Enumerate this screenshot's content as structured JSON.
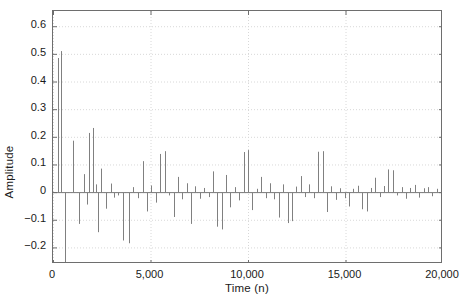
{
  "chart_data": {
    "type": "line",
    "subtype": "stem",
    "title": "",
    "xlabel": "Time (n)",
    "ylabel": "Amplitude",
    "xlim": [
      0,
      20000
    ],
    "ylim": [
      -0.26,
      0.655
    ],
    "xticks": [
      0,
      5000,
      10000,
      15000,
      20000
    ],
    "xticklabels": [
      "0",
      "5,000",
      "10,000",
      "15,000",
      "20,000"
    ],
    "yticks": [
      -0.2,
      -0.1,
      0,
      0.1,
      0.2,
      0.3,
      0.4,
      0.5,
      0.6
    ],
    "yticklabels": [
      "-0.2",
      "-0.1",
      "0",
      "0.1",
      "0.2",
      "0.3",
      "0.4",
      "0.5",
      "0.6"
    ],
    "grid": true,
    "grid_style": "dotted",
    "grid_color": "#d8d8d8",
    "legend": null,
    "line_color": "#808080",
    "axis_color": "#6e6e6e",
    "baseline": 0,
    "x": [
      250,
      430,
      610,
      1000,
      1320,
      1600,
      1720,
      1850,
      2050,
      2180,
      2320,
      2480,
      2700,
      2980,
      3150,
      3350,
      3600,
      3900,
      4120,
      4380,
      4600,
      4820,
      5050,
      5280,
      5500,
      5720,
      5950,
      6180,
      6400,
      6620,
      6850,
      7080,
      7300,
      7530,
      7750,
      7980,
      8200,
      8430,
      8650,
      8880,
      9100,
      9330,
      9550,
      9780,
      10000,
      10230,
      10450,
      10680,
      10900,
      11130,
      11350,
      11580,
      11800,
      12030,
      12250,
      12480,
      12700,
      12930,
      13150,
      13380,
      13600,
      13830,
      14050,
      14280,
      14500,
      14730,
      14950,
      15180,
      15400,
      15630,
      15850,
      16080,
      16300,
      16530,
      16750,
      16980,
      17200,
      17430,
      17650,
      17880,
      18100,
      18330,
      18550,
      18780,
      19000,
      19230,
      19450,
      19680,
      19900
    ],
    "y": [
      0.485,
      0.51,
      -0.255,
      0.186,
      -0.115,
      0.065,
      -0.045,
      0.214,
      0.232,
      0.028,
      -0.145,
      0.085,
      -0.06,
      0.031,
      -0.02,
      -0.012,
      -0.175,
      -0.185,
      0.018,
      -0.022,
      0.112,
      -0.07,
      0.024,
      -0.038,
      0.138,
      0.148,
      -0.012,
      -0.09,
      0.055,
      -0.026,
      0.032,
      -0.115,
      0.021,
      -0.024,
      0.015,
      -0.018,
      0.075,
      -0.125,
      -0.135,
      0.062,
      -0.055,
      0.018,
      -0.03,
      0.145,
      0.152,
      -0.065,
      0.012,
      0.055,
      -0.022,
      0.032,
      -0.026,
      -0.092,
      0.028,
      -0.112,
      -0.105,
      0.02,
      0.058,
      -0.018,
      0.028,
      -0.022,
      0.146,
      0.148,
      -0.072,
      0.021,
      -0.028,
      0.014,
      -0.022,
      -0.052,
      0.012,
      0.023,
      -0.062,
      -0.07,
      0.015,
      0.052,
      -0.018,
      0.022,
      0.082,
      0.079,
      -0.012,
      0.018,
      -0.024,
      0.015,
      0.026,
      -0.02,
      0.014,
      0.018,
      -0.015,
      0.012,
      0.028
    ]
  }
}
